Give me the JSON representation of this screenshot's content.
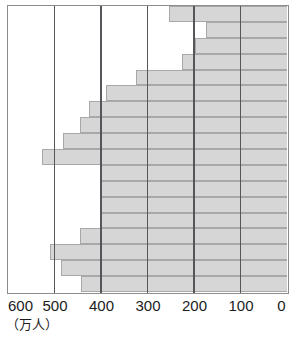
{
  "chart_data": {
    "type": "bar",
    "orientation": "horizontal",
    "title": "",
    "xlabel": "",
    "ylabel": "",
    "unit_label": "（万人）",
    "xlim": [
      0,
      600
    ],
    "x_reversed": true,
    "grid": true,
    "legend": "none",
    "axis_ticks": [
      600,
      500,
      400,
      300,
      200,
      100,
      0
    ],
    "tick_labels": [
      "600",
      "500",
      "400",
      "300",
      "200",
      "100",
      "0"
    ],
    "bar_color": "#d6d6d6",
    "bar_border_color": "#a8a8a8",
    "grid_color": "#55565a",
    "frame_color": "#8d8d8d",
    "categories": [
      "row-1",
      "row-2",
      "row-3",
      "row-4",
      "row-5",
      "row-6",
      "row-7",
      "row-8",
      "row-9",
      "row-10",
      "row-11",
      "row-12",
      "row-13",
      "row-14",
      "row-15",
      "row-16",
      "row-17",
      "row-18"
    ],
    "values": [
      253,
      174,
      197,
      225,
      324,
      390,
      425,
      446,
      481,
      526,
      399,
      399,
      399,
      399,
      446,
      509,
      485,
      443
    ]
  }
}
